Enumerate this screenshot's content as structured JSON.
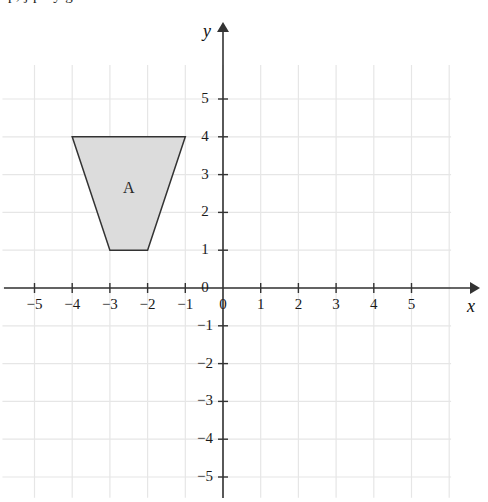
{
  "page": {
    "top_cut_text": "p, j    p      .   y   g"
  },
  "axes": {
    "x_label": "x",
    "y_label": "y",
    "origin_label_x": "0",
    "origin_label_y": "0",
    "x_tick_labels": [
      "−5",
      "−4",
      "−3",
      "−2",
      "−1",
      "1",
      "2",
      "3",
      "4",
      "5"
    ],
    "y_tick_labels": [
      "5",
      "4",
      "3",
      "2",
      "1",
      "−1",
      "−2",
      "−3",
      "−4",
      "−5"
    ],
    "x_min": -5.85,
    "x_max": 6.05,
    "y_min": -5.55,
    "y_max": 5.9,
    "grid": true
  },
  "colors": {
    "grid_line": "#e6e6e6",
    "axis_line": "#333333",
    "shape_fill": "#dcdcdc",
    "shape_stroke": "#333333",
    "text": "#1a1a1a"
  },
  "chart_data": {
    "type": "scatter",
    "title": "",
    "xlabel": "x",
    "ylabel": "y",
    "xlim": [
      -5.85,
      6.05
    ],
    "ylim": [
      -5.55,
      5.9
    ],
    "grid": true,
    "shapes": [
      {
        "name": "A",
        "label": "A",
        "type": "trapezoid",
        "vertices": [
          [
            -4,
            4
          ],
          [
            -1,
            4
          ],
          [
            -2,
            1
          ],
          [
            -3,
            1
          ]
        ],
        "label_position": [
          -2.5,
          2.65
        ],
        "fill": "#dcdcdc",
        "stroke": "#333333"
      }
    ]
  }
}
